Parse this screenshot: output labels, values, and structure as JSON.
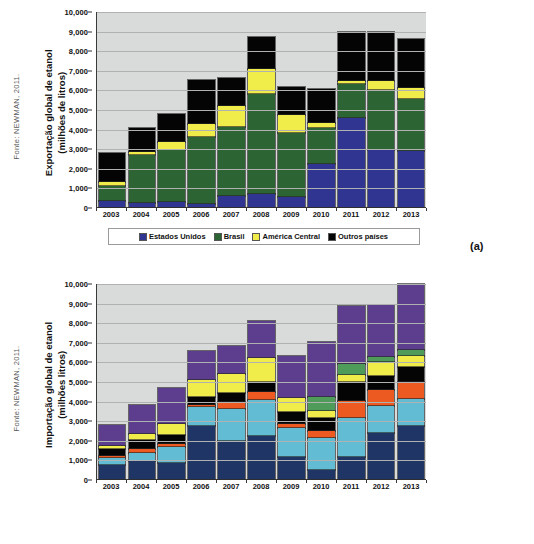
{
  "figures": [
    {
      "id": "a",
      "tag": "(a)",
      "source": "Fonte: NEWMAN, 2011.",
      "ytitle_line1": "Exportação global de etanol",
      "ytitle_line2": "(milhões de litros)",
      "chart_data": {
        "type": "bar",
        "stacked": true,
        "title": "Exportação global de etanol (milhões de litros)",
        "xlabel": "",
        "ylabel": "Exportação global de etanol (milhões de litros)",
        "ylim": [
          0,
          10000
        ],
        "ytick_labels": [
          "10,000",
          "9,000",
          "8,000",
          "7,000",
          "6,000",
          "5,000",
          "4,000",
          "3,000",
          "2,000",
          "1,000",
          "0"
        ],
        "ytick_values": [
          10000,
          9000,
          8000,
          7000,
          6000,
          5000,
          4000,
          3000,
          2000,
          1000,
          0
        ],
        "grid": true,
        "legend_position": "bottom",
        "categories": [
          "2003",
          "2004",
          "2005",
          "2006",
          "2007",
          "2008",
          "2009",
          "2010",
          "2011",
          "2012",
          "2013"
        ],
        "series": [
          {
            "name": "Estados Unidos",
            "color": "#2f3590",
            "values": [
              330,
              230,
              270,
              170,
              550,
              650,
              520,
              2180,
              4560,
              2900,
              2840
            ]
          },
          {
            "name": "Brasil",
            "color": "#2d6433",
            "values": [
              760,
              2420,
              2630,
              3390,
              3520,
              5100,
              3260,
              1870,
              1720,
              3080,
              2650
            ]
          },
          {
            "name": "América Central",
            "color": "#f0ec4a",
            "values": [
              200,
              180,
              400,
              700,
              1080,
              1300,
              900,
              230,
              130,
              430,
              580
            ]
          },
          {
            "name": "Outros países",
            "color": "#040404",
            "values": [
              1480,
              1180,
              1450,
              2230,
              1440,
              1640,
              1440,
              1720,
              2500,
              2500,
              2500
            ]
          }
        ],
        "totals": [
          2770,
          4010,
          4750,
          6490,
          6590,
          8690,
          6120,
          6000,
          8910,
          8910,
          8570
        ]
      },
      "legend": [
        {
          "label": "Estados Unidos",
          "color": "#2f3590"
        },
        {
          "label": "Brasil",
          "color": "#2d6433"
        },
        {
          "label": "América Central",
          "color": "#f0ec4a"
        },
        {
          "label": "Outros países",
          "color": "#040404"
        }
      ]
    },
    {
      "id": "b",
      "tag": "(b)",
      "source": "Fonte: NEWMAN, 2011.",
      "ytitle_line1": "Importação global de etanol",
      "ytitle_line2": "(milhões litros)",
      "chart_data": {
        "type": "bar",
        "stacked": true,
        "title": "Importação global de etanol (milhões litros)",
        "xlabel": "",
        "ylabel": "Importação global de etanol (milhões litros)",
        "ylim": [
          0,
          10000
        ],
        "ytick_labels": [
          "10,000",
          "9,000",
          "8,000",
          "7,000",
          "6,000",
          "5,000",
          "4,000",
          "3,000",
          "2,000",
          "1,000",
          "0"
        ],
        "ytick_values": [
          10000,
          9000,
          8000,
          7000,
          6000,
          5000,
          4000,
          3000,
          2000,
          1000,
          0
        ],
        "grid": true,
        "legend_position": "bottom",
        "categories": [
          "2003",
          "2004",
          "2005",
          "2006",
          "2007",
          "2008",
          "2009",
          "2010",
          "2011",
          "2012",
          "2013"
        ],
        "series": [
          {
            "name": "EUA",
            "color": "#1f3566",
            "values": [
              700,
              900,
              800,
              2700,
              1930,
              2200,
              1100,
              460,
              1130,
              2340,
              2720
            ]
          },
          {
            "name": "UE",
            "color": "#62bcd4",
            "values": [
              350,
              430,
              830,
              1000,
              1660,
              1830,
              1500,
              1630,
              1980,
              1390,
              1370
            ]
          },
          {
            "name": "Canada",
            "color": "#ec5a22",
            "values": [
              130,
              180,
              170,
              100,
              360,
              420,
              210,
              380,
              880,
              790,
              880
            ]
          },
          {
            "name": "Japão",
            "color": "#040404",
            "values": [
              330,
              480,
              440,
              370,
              450,
              520,
              590,
              640,
              960,
              750,
              750
            ]
          },
          {
            "name": "America Central",
            "color": "#f0ec4a",
            "values": [
              190,
              330,
              580,
              890,
              970,
              1220,
              750,
              380,
              340,
              680,
              610
            ]
          },
          {
            "name": "Brasil",
            "color": "#4f9c5a",
            "values": [
              0,
              0,
              0,
              0,
              0,
              0,
              0,
              720,
              580,
              300,
              280
            ]
          },
          {
            "name": "Outros",
            "color": "#5d3d8e",
            "values": [
              1060,
              1440,
              1830,
              1460,
              1410,
              1890,
              2140,
              2760,
              2940,
              2640,
              3390
            ]
          }
        ],
        "totals": [
          2760,
          3760,
          4650,
          6520,
          6780,
          8080,
          6290,
          6970,
          8810,
          8890,
          10000
        ]
      },
      "legend": [
        {
          "label": "EUA",
          "color": "#1f3566"
        },
        {
          "label": "UE",
          "color": "#62bcd4"
        },
        {
          "label": "Canada",
          "color": "#ec5a22"
        },
        {
          "label": "Japão",
          "color": "#040404"
        },
        {
          "label": "America Central",
          "color": "#f0ec4a"
        },
        {
          "label": "Brasil",
          "color": "#4f9c5a"
        },
        {
          "label": "Outros",
          "color": "#5d3d8e"
        }
      ]
    }
  ]
}
